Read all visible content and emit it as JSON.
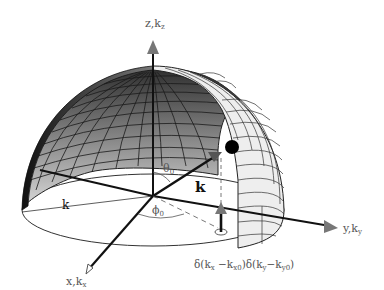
{
  "diagram": {
    "axes": {
      "z_label": "z,k",
      "z_sub": "z",
      "y_label": "y,k",
      "y_sub": "y",
      "x_label": "x,k",
      "x_sub": "x"
    },
    "labels": {
      "theta": "θ",
      "theta_sub": "0",
      "phi": "ϕ",
      "phi_sub": "0",
      "k_vector": "k",
      "k_radius": "k",
      "delta_expression": "δ(kₓ−kₓ₀)δ(kᵧ−kᵧ₀)"
    },
    "delta_parts": {
      "d1": "δ(k",
      "s1": "x",
      "m1": " −k",
      "s2": "x0",
      "d2": ")δ(k",
      "s3": "y",
      "m2": "−k",
      "s4": "y0",
      "end": ")"
    },
    "colors": {
      "shell_dark": "#3a3a3a",
      "shell_mid": "#8a8a8a",
      "shell_light": "#eeeeee",
      "axis": "#222222",
      "arrow_head": "#777777"
    }
  }
}
